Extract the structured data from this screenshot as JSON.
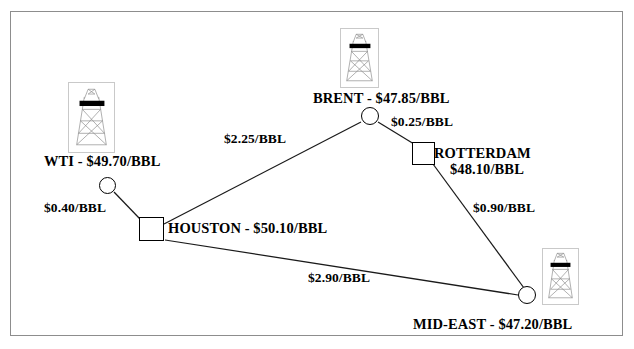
{
  "diagram": {
    "frame": {
      "border_color": "#8d8d8d"
    },
    "line_color": "#1a1a1a",
    "text_color": "#000000",
    "currency_unit": "$/BBL",
    "nodes": [
      {
        "id": "wti",
        "label": "WTI - $49.70/BBL",
        "name": "WTI",
        "price": "$49.70/BBL",
        "shape": "circle",
        "icon": "oil-rig-icon",
        "has_icon": true
      },
      {
        "id": "brent",
        "label": "BRENT - $47.85/BBL",
        "name": "BRENT",
        "price": "$47.85/BBL",
        "shape": "circle",
        "icon": "oil-rig-icon",
        "has_icon": true
      },
      {
        "id": "houston",
        "label": "HOUSTON - $50.10/BBL",
        "name": "HOUSTON",
        "price": "$50.10/BBL",
        "shape": "square",
        "icon": "none",
        "has_icon": false
      },
      {
        "id": "rotterdam",
        "label": "ROTTERDAM",
        "name": "ROTTERDAM",
        "price": "$48.10/BBL",
        "shape": "square",
        "icon": "none",
        "has_icon": false
      },
      {
        "id": "mideast",
        "label": "MID-EAST - $47.20/BBL",
        "name": "MID-EAST",
        "price": "$47.20/BBL",
        "shape": "circle",
        "icon": "oil-rig-icon",
        "has_icon": true
      }
    ],
    "edges": [
      {
        "id": "wti-houston",
        "from": "wti",
        "to": "houston",
        "label": "$0.40/BBL",
        "value": 0.4
      },
      {
        "id": "houston-brent",
        "from": "houston",
        "to": "brent",
        "label": "$2.25/BBL",
        "value": 2.25
      },
      {
        "id": "brent-rotterdam",
        "from": "brent",
        "to": "rotterdam",
        "label": "$0.25/BBL",
        "value": 0.25
      },
      {
        "id": "rotterdam-mideast",
        "from": "rotterdam",
        "to": "mideast",
        "label": "$0.90/BBL",
        "value": 0.9
      },
      {
        "id": "houston-mideast",
        "from": "houston",
        "to": "mideast",
        "label": "$2.90/BBL",
        "value": 2.9
      }
    ]
  }
}
